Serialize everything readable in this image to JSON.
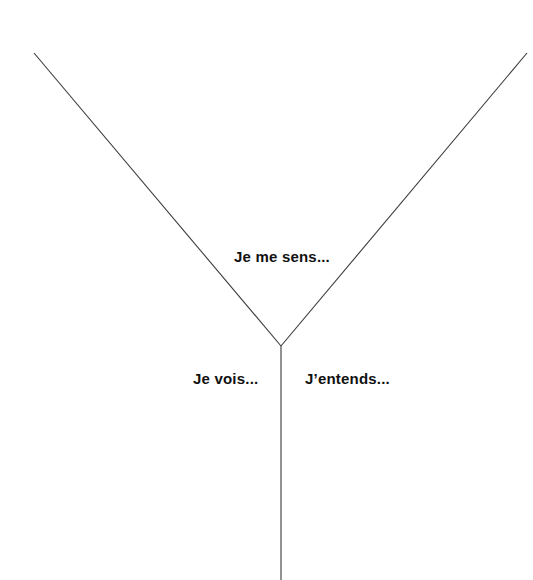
{
  "diagram": {
    "type": "y-chart",
    "colors": {
      "line": "#3a3a3a",
      "text": "#111111",
      "background": "#ffffff"
    },
    "sections": {
      "top": {
        "label": "Je me sens..."
      },
      "left": {
        "label": "Je vois..."
      },
      "right": {
        "label": "J’entends..."
      }
    }
  }
}
